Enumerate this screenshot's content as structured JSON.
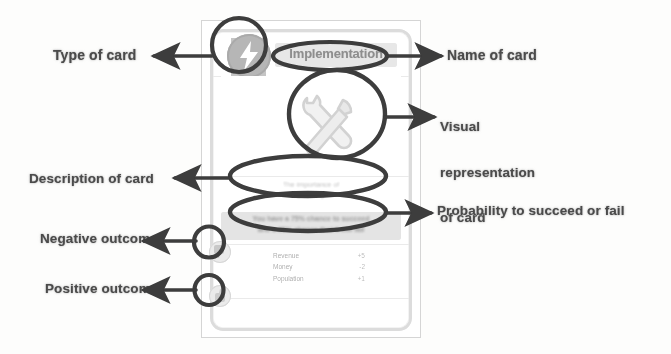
{
  "diagram": {
    "style": "scanned annotated diagram"
  },
  "annotations": {
    "left": [
      {
        "id": "type-of-card",
        "text": "Type of card"
      },
      {
        "id": "description-of-card",
        "text": "Description of card"
      },
      {
        "id": "negative-outcome",
        "text": "Negative outcome"
      },
      {
        "id": "positive-outcome",
        "text": "Positive outcome"
      }
    ],
    "right": [
      {
        "id": "name-of-card",
        "text": "Name of card"
      },
      {
        "id": "visual-representation",
        "line1": "Visual",
        "line2": "representation",
        "line3": "of card"
      },
      {
        "id": "probability",
        "text": "Probability to succeed or fail"
      }
    ]
  },
  "card": {
    "title": "Implementation",
    "badge_icon": "lightning-bolt-icon",
    "art_icon": "wrench-and-hammer-icon",
    "description_line1": "The importance of",
    "description_line2": "planning",
    "probability_line1": "You have a 75% chance to succeed",
    "probability_line2": "and a 25% chance that it will fail",
    "stats": [
      {
        "label": "Revenue",
        "value": "+5"
      },
      {
        "label": "Money",
        "value": "-2"
      },
      {
        "label": "Population",
        "value": "+1"
      }
    ],
    "negative_outcome_icon": "thumbs-down-icon",
    "positive_outcome_icon": "thumbs-up-icon"
  },
  "colors": {
    "ink": "#3a3a3a",
    "label_text": "#4d4d4d",
    "card_border": "#d8d8d8",
    "badge_fill": "#b4b4b4",
    "plate_fill": "#e3e3e3",
    "page_bg": "#fdfdfc"
  }
}
